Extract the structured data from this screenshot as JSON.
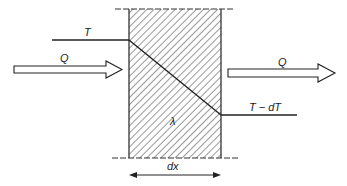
{
  "diagram": {
    "labels": {
      "temp_in": "T",
      "temp_out": "T − dT",
      "heat_in": "Q",
      "heat_out": "Q",
      "conductivity": "λ",
      "thickness": "dx"
    },
    "colors": {
      "line": "#222222",
      "hatch": "#555555",
      "background": "#ffffff"
    },
    "geometry": {
      "wall_left_x": 129,
      "wall_right_x": 221,
      "wall_top_y": 9,
      "wall_bottom_y": 158,
      "temp_in_y": 40,
      "temp_out_y": 115
    }
  }
}
